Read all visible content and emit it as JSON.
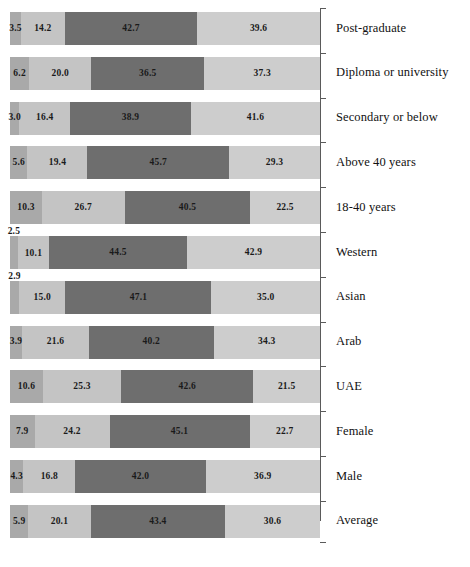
{
  "chart_data": {
    "type": "bar",
    "orientation": "horizontal",
    "stacked": true,
    "title": "",
    "subtitle": "",
    "xlabel": "",
    "ylabel": "",
    "xlim": [
      0,
      100
    ],
    "grid": false,
    "legend_position": "none",
    "units": "percent",
    "categories": [
      "Post-graduate",
      "Diploma or university",
      "Secondary or below",
      "Above 40 years",
      "18-40 years",
      "Western",
      "Asian",
      "Arab",
      "UAE",
      "Female",
      "Male",
      "Average"
    ],
    "series": [
      {
        "name": "segment-1",
        "color": "#a9a9a9",
        "values": [
          3.5,
          6.2,
          3.0,
          5.6,
          10.3,
          2.5,
          2.9,
          3.9,
          10.6,
          7.9,
          4.3,
          5.9
        ]
      },
      {
        "name": "segment-2",
        "color": "#c4c4c4",
        "values": [
          14.2,
          20.0,
          16.4,
          19.4,
          26.7,
          10.1,
          15.0,
          21.6,
          25.3,
          24.2,
          16.8,
          20.1
        ]
      },
      {
        "name": "segment-3",
        "color": "#6e6e6e",
        "values": [
          42.7,
          36.5,
          38.9,
          45.7,
          40.5,
          44.5,
          47.1,
          40.2,
          42.6,
          45.1,
          42.0,
          43.4
        ]
      },
      {
        "name": "segment-4",
        "color": "#cdcdcd",
        "values": [
          39.6,
          37.3,
          41.6,
          29.3,
          22.5,
          42.9,
          35.0,
          34.3,
          21.5,
          22.7,
          36.9,
          30.6
        ]
      }
    ],
    "rows": [
      {
        "label": "Post-graduate",
        "values": [
          3.5,
          14.2,
          42.7,
          39.6
        ],
        "labels": [
          "3.5",
          "14.2",
          "42.7",
          "39.6"
        ],
        "raised": [
          false,
          false,
          false,
          false
        ]
      },
      {
        "label": "Diploma or university",
        "values": [
          6.2,
          20.0,
          36.5,
          37.3
        ],
        "labels": [
          "6.2",
          "20.0",
          "36.5",
          "37.3"
        ],
        "raised": [
          false,
          false,
          false,
          false
        ]
      },
      {
        "label": "Secondary or below",
        "values": [
          3.0,
          16.4,
          38.9,
          41.6
        ],
        "labels": [
          "3.0",
          "16.4",
          "38.9",
          "41.6"
        ],
        "raised": [
          false,
          false,
          false,
          false
        ]
      },
      {
        "label": "Above 40 years",
        "values": [
          5.6,
          19.4,
          45.7,
          29.3
        ],
        "labels": [
          "5.6",
          "19.4",
          "45.7",
          "29.3"
        ],
        "raised": [
          false,
          false,
          false,
          false
        ]
      },
      {
        "label": "18-40 years",
        "values": [
          10.3,
          26.7,
          40.5,
          22.5
        ],
        "labels": [
          "10.3",
          "26.7",
          "40.5",
          "22.5"
        ],
        "raised": [
          false,
          false,
          false,
          false
        ]
      },
      {
        "label": "Western",
        "values": [
          2.5,
          10.1,
          44.5,
          42.9
        ],
        "labels": [
          "2.5",
          "10.1",
          "44.5",
          "42.9"
        ],
        "raised": [
          "above",
          "below",
          false,
          false
        ]
      },
      {
        "label": "Asian",
        "values": [
          2.9,
          15.0,
          47.1,
          35.0
        ],
        "labels": [
          "2.9",
          "15.0",
          "47.1",
          "35.0"
        ],
        "raised": [
          "above",
          false,
          false,
          false
        ]
      },
      {
        "label": "Arab",
        "values": [
          3.9,
          21.6,
          40.2,
          34.3
        ],
        "labels": [
          "3.9",
          "21.6",
          "40.2",
          "34.3"
        ],
        "raised": [
          false,
          false,
          false,
          false
        ]
      },
      {
        "label": "UAE",
        "values": [
          10.6,
          25.3,
          42.6,
          21.5
        ],
        "labels": [
          "10.6",
          "25.3",
          "42.6",
          "21.5"
        ],
        "raised": [
          false,
          false,
          false,
          false
        ]
      },
      {
        "label": "Female",
        "values": [
          7.9,
          24.2,
          45.1,
          22.7
        ],
        "labels": [
          "7.9",
          "24.2",
          "45.1",
          "22.7"
        ],
        "raised": [
          false,
          false,
          false,
          false
        ]
      },
      {
        "label": "Male",
        "values": [
          4.3,
          16.8,
          42.0,
          36.9
        ],
        "labels": [
          "4.3",
          "16.8",
          "42.0",
          "36.9"
        ],
        "raised": [
          false,
          false,
          false,
          false
        ]
      },
      {
        "label": "Average",
        "values": [
          5.9,
          20.1,
          43.4,
          30.6
        ],
        "labels": [
          "5.9",
          "20.1",
          "43.4",
          "30.6"
        ],
        "raised": [
          false,
          false,
          false,
          false
        ]
      }
    ]
  },
  "style": {
    "segment_colors": [
      "#a9a9a9",
      "#c4c4c4",
      "#6e6e6e",
      "#cdcdcd"
    ],
    "axis_color": "#5a5a5a",
    "text_color": "#111111",
    "background": "#ffffff"
  },
  "layout": {
    "bar_left": 10,
    "bar_width": 310,
    "bar_height": 33,
    "row_pitch": 44.8,
    "first_row_top": 12,
    "label_left": 336,
    "axis_x": 320
  }
}
